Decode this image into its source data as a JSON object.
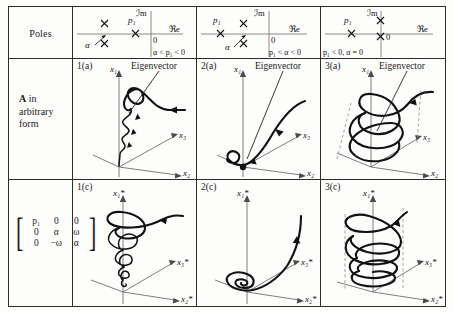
{
  "table": {
    "row_labels": {
      "poles": "Poles",
      "arbitrary_line1": "A",
      "arbitrary_line2": "in",
      "arbitrary_line3": "arbitrary",
      "arbitrary_line4": "form"
    },
    "matrix": {
      "left_bracket": "[",
      "right_bracket": "]",
      "rows": [
        [
          "p₁",
          "0",
          "0"
        ],
        [
          "0",
          "α",
          "ω"
        ],
        [
          "0",
          "−ω",
          "α"
        ]
      ]
    },
    "pole_diagrams": [
      {
        "name": "case-1",
        "imaginary_axis_label": "ℐm",
        "real_axis_label": "ℜe",
        "origin_label": "0",
        "pole_label": "p₁",
        "alpha_label": "α",
        "condition": "α < p₁ < 0"
      },
      {
        "name": "case-2",
        "imaginary_axis_label": "ℐm",
        "real_axis_label": "ℜe",
        "origin_label": "0",
        "pole_label": "p₁",
        "alpha_label": "α",
        "condition": "p₁ < α < 0"
      },
      {
        "name": "case-3",
        "imaginary_axis_label": "ℐm",
        "real_axis_label": "ℜe",
        "origin_label": "0",
        "pole_label": "p₁",
        "alpha_label": "",
        "condition": "p₁ < 0, α = 0"
      }
    ],
    "arbitrary_cells": [
      {
        "tag": "1(a)",
        "axis_x1": "x₁",
        "axis_x2": "x₂",
        "axis_x3": "x₃",
        "eigenvector_label": "Eigenvector"
      },
      {
        "tag": "2(a)",
        "axis_x1": "x₁",
        "axis_x2": "x₂",
        "axis_x3": "x₃",
        "eigenvector_label": "Eigenvector"
      },
      {
        "tag": "3(a)",
        "axis_x1": "x₁",
        "axis_x2": "x₂",
        "axis_x3": "x₃",
        "eigenvector_label": "Eigenvector"
      }
    ],
    "diagonal_cells": [
      {
        "tag": "1(c)",
        "axis_x1": "x₁*",
        "axis_x2": "x₂*",
        "axis_x3": "x₃*"
      },
      {
        "tag": "2(c)",
        "axis_x1": "x₁*",
        "axis_x2": "x₂*",
        "axis_x3": "x₃*"
      },
      {
        "tag": "3(c)",
        "axis_x1": "x₁*",
        "axis_x2": "x₂*",
        "axis_x3": "x₃*"
      }
    ]
  },
  "colors": {
    "border": "#2b2b2b",
    "trajectory": "#111111",
    "axis": "#6e6e6e",
    "dashed_guide": "#8a8a8a"
  }
}
